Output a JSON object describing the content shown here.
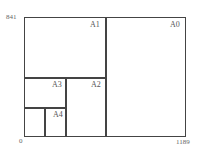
{
  "diagram": {
    "axis": {
      "y_max_label": "841",
      "origin_label": "0",
      "x_max_label": "1189"
    },
    "regions": [
      {
        "id": "A0",
        "label": "A0"
      },
      {
        "id": "A1",
        "label": "A1"
      },
      {
        "id": "A2",
        "label": "A2"
      },
      {
        "id": "A3",
        "label": "A3"
      },
      {
        "id": "A4",
        "label": "A4"
      }
    ],
    "caption": ""
  }
}
